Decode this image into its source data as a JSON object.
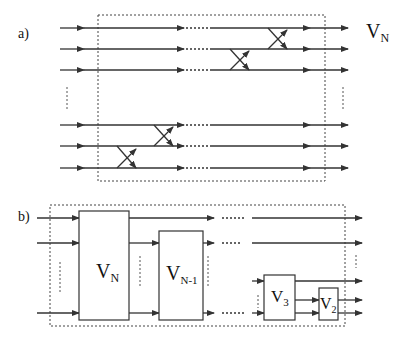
{
  "panel_a": {
    "label": "a)",
    "output_label": "V",
    "output_label_sub": "N",
    "wires_top": [
      28,
      49,
      70
    ],
    "wires_bottom": [
      125,
      146,
      168
    ],
    "swaps": [
      {
        "x": 240,
        "y1": 49,
        "y2": 70
      },
      {
        "x": 278,
        "y1": 28,
        "y2": 49
      },
      {
        "x": 125,
        "y1": 146,
        "y2": 168
      },
      {
        "x": 163,
        "y1": 125,
        "y2": 146
      }
    ]
  },
  "panel_b": {
    "label": "b)",
    "blocks": [
      {
        "name": "V",
        "sub": "N"
      },
      {
        "name": "V",
        "sub": "N-1"
      },
      {
        "name": "V",
        "sub": "3"
      },
      {
        "name": "V",
        "sub": "2"
      }
    ]
  },
  "colors": {
    "line": "#333333",
    "background": "#ffffff"
  }
}
